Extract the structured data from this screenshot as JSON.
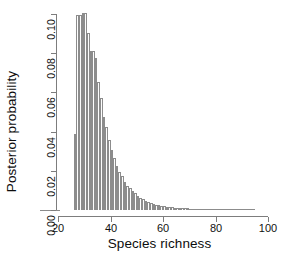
{
  "figure": {
    "background": "#ffffff",
    "bar_fill": "#fdfdfd",
    "bar_stroke": "#8c8c8c",
    "axis_color": "#7d7d7d"
  },
  "chart_data": {
    "type": "bar",
    "title": "",
    "xlabel": "Species richness",
    "ylabel": "Posterior probability",
    "xlim": [
      20,
      100
    ],
    "ylim": [
      0.0,
      0.105
    ],
    "xticks": [
      20,
      40,
      60,
      80,
      100
    ],
    "xtick_labels": [
      "20",
      "40",
      "60",
      "80",
      "100"
    ],
    "yticks": [
      0.0,
      0.02,
      0.04,
      0.06,
      0.08,
      0.1
    ],
    "ytick_labels": [
      "0.00",
      "0.02",
      "0.04",
      "0.06",
      "0.08",
      "0.10"
    ],
    "grid": false,
    "legend": false,
    "bin_width": 1,
    "categories": [
      26,
      27,
      28,
      29,
      30,
      31,
      32,
      33,
      34,
      35,
      36,
      37,
      38,
      39,
      40,
      41,
      42,
      43,
      44,
      45,
      46,
      47,
      48,
      49,
      50,
      51,
      52,
      53,
      54,
      55,
      56,
      57,
      58,
      59,
      60,
      61,
      62,
      63,
      64,
      65,
      66,
      67,
      68,
      69,
      70,
      71,
      72,
      73,
      74,
      75,
      76,
      77,
      78,
      79,
      80,
      81,
      82,
      83,
      84,
      85,
      86,
      87,
      88,
      89,
      90,
      91,
      92,
      93,
      94
    ],
    "values": [
      0.039,
      0.0995,
      0.0995,
      0.1005,
      0.1005,
      0.0905,
      0.081,
      0.081,
      0.0775,
      0.0655,
      0.057,
      0.0475,
      0.0425,
      0.0355,
      0.0305,
      0.0265,
      0.0225,
      0.0195,
      0.0175,
      0.0145,
      0.0125,
      0.011,
      0.0098,
      0.0085,
      0.0072,
      0.0062,
      0.0055,
      0.0048,
      0.0042,
      0.0036,
      0.0032,
      0.0028,
      0.0025,
      0.0022,
      0.0019,
      0.0017,
      0.0015,
      0.0014,
      0.0012,
      0.0011,
      0.001,
      0.0009,
      0.0008,
      0.0008,
      0.0007,
      0.0006,
      0.0006,
      0.0005,
      0.0005,
      0.0004,
      0.0004,
      0.0004,
      0.0003,
      0.0003,
      0.0003,
      0.0002,
      0.0002,
      0.0002,
      0.0002,
      0.0002,
      0.0001,
      0.0001,
      0.0001,
      0.0001,
      0.0001,
      0.0001,
      0.0001,
      0.0001,
      0.0001
    ]
  }
}
